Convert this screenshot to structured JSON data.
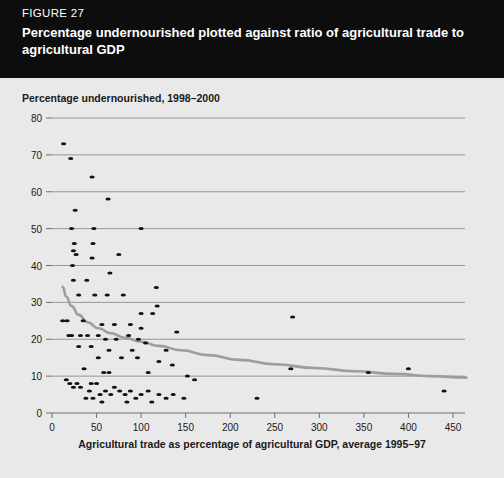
{
  "header": {
    "figure_number": "FIGURE 27",
    "title": "Percentage undernourished plotted against ratio of agricultural trade to agricultural GDP"
  },
  "chart_data": {
    "type": "scatter",
    "title": "",
    "ylabel": "Percentage undernourished, 1998–2000",
    "xlabel": "Agricultural trade as percentage of agricultural GDP, average 1995–97",
    "xlim": [
      0,
      450
    ],
    "ylim": [
      0,
      80
    ],
    "x_ticks": [
      0,
      50,
      100,
      150,
      200,
      250,
      300,
      350,
      400,
      450
    ],
    "y_ticks": [
      0,
      10,
      20,
      30,
      40,
      50,
      60,
      70,
      80
    ],
    "grid": "horizontal",
    "legend": "none",
    "marker_color": "#111111",
    "trend_color": "#9d9d9d",
    "gridline_color": "#8d8d8d",
    "background_color": "#e9e9e9",
    "series": [
      {
        "name": "Countries",
        "points": [
          [
            13,
            73
          ],
          [
            21,
            69
          ],
          [
            45,
            64
          ],
          [
            63,
            58
          ],
          [
            26,
            55
          ],
          [
            22,
            50
          ],
          [
            47,
            50
          ],
          [
            100,
            50
          ],
          [
            25,
            46
          ],
          [
            46,
            46
          ],
          [
            24,
            44
          ],
          [
            27,
            43
          ],
          [
            45,
            42
          ],
          [
            75,
            43
          ],
          [
            23,
            40
          ],
          [
            65,
            38
          ],
          [
            24,
            36
          ],
          [
            39,
            36
          ],
          [
            117,
            34
          ],
          [
            30,
            32
          ],
          [
            48,
            32
          ],
          [
            62,
            32
          ],
          [
            80,
            32
          ],
          [
            118,
            29
          ],
          [
            100,
            27
          ],
          [
            113,
            27
          ],
          [
            270,
            26
          ],
          [
            12,
            25
          ],
          [
            17,
            25
          ],
          [
            35,
            25
          ],
          [
            56,
            24
          ],
          [
            70,
            24
          ],
          [
            88,
            24
          ],
          [
            100,
            23
          ],
          [
            140,
            22
          ],
          [
            19,
            21
          ],
          [
            22,
            21
          ],
          [
            32,
            21
          ],
          [
            40,
            21
          ],
          [
            52,
            21
          ],
          [
            60,
            20
          ],
          [
            72,
            20
          ],
          [
            86,
            21
          ],
          [
            97,
            20
          ],
          [
            105,
            19
          ],
          [
            30,
            18
          ],
          [
            44,
            18
          ],
          [
            64,
            17
          ],
          [
            90,
            17
          ],
          [
            128,
            17
          ],
          [
            52,
            15
          ],
          [
            78,
            15
          ],
          [
            96,
            15
          ],
          [
            120,
            14
          ],
          [
            135,
            13
          ],
          [
            268,
            12
          ],
          [
            36,
            12
          ],
          [
            58,
            11
          ],
          [
            64,
            11
          ],
          [
            108,
            11
          ],
          [
            152,
            10
          ],
          [
            160,
            9
          ],
          [
            355,
            11
          ],
          [
            400,
            12
          ],
          [
            16,
            9
          ],
          [
            20,
            8
          ],
          [
            28,
            8
          ],
          [
            24,
            7
          ],
          [
            32,
            7
          ],
          [
            44,
            8
          ],
          [
            50,
            8
          ],
          [
            42,
            6
          ],
          [
            54,
            5
          ],
          [
            60,
            6
          ],
          [
            66,
            5
          ],
          [
            70,
            7
          ],
          [
            76,
            6
          ],
          [
            82,
            5
          ],
          [
            88,
            6
          ],
          [
            94,
            4
          ],
          [
            100,
            5
          ],
          [
            108,
            6
          ],
          [
            120,
            5
          ],
          [
            128,
            4
          ],
          [
            136,
            5
          ],
          [
            148,
            4
          ],
          [
            230,
            4
          ],
          [
            440,
            6
          ],
          [
            38,
            4
          ],
          [
            46,
            4
          ],
          [
            56,
            3
          ],
          [
            84,
            3
          ],
          [
            112,
            3
          ]
        ]
      }
    ],
    "trend_line": {
      "name": "fitted trend",
      "points": [
        [
          12,
          34.2
        ],
        [
          16,
          31.5
        ],
        [
          22,
          29.0
        ],
        [
          30,
          26.6
        ],
        [
          40,
          24.6
        ],
        [
          52,
          23.0
        ],
        [
          66,
          21.6
        ],
        [
          82,
          20.4
        ],
        [
          100,
          19.3
        ],
        [
          120,
          18.2
        ],
        [
          145,
          17.0
        ],
        [
          175,
          15.7
        ],
        [
          210,
          14.4
        ],
        [
          250,
          13.2
        ],
        [
          295,
          12.2
        ],
        [
          340,
          11.3
        ],
        [
          385,
          10.6
        ],
        [
          425,
          10.0
        ],
        [
          465,
          9.6
        ]
      ]
    }
  }
}
